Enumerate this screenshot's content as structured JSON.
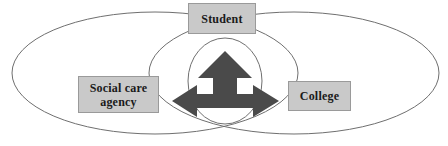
{
  "diagram": {
    "canvas": {
      "width": 448,
      "height": 146,
      "background": "#ffffff"
    },
    "colors": {
      "box_fill": "#c9c9c9",
      "box_border": "#9a9a9a",
      "box_text": "#1a1a1a",
      "ellipse_stroke": "#6f6f6f",
      "arrow_fill": "#4a4a4a"
    },
    "nodes": [
      {
        "id": "student",
        "label": "Student"
      },
      {
        "id": "social_care_agency",
        "label": "Social care\nagency"
      },
      {
        "id": "college",
        "label": "College"
      }
    ],
    "ellipses": [
      {
        "id": "left-ellipse",
        "cx": 155,
        "cy": 73,
        "rx": 143,
        "ry": 61
      },
      {
        "id": "right-ellipse",
        "cx": 294,
        "cy": 73,
        "rx": 145,
        "ry": 61
      },
      {
        "id": "center-ellipse",
        "cx": 225,
        "cy": 81,
        "rx": 37,
        "ry": 43
      }
    ],
    "arrow": {
      "id": "three-way-arrow",
      "directions": [
        "up",
        "left",
        "right"
      ],
      "center_x": 225,
      "center_y": 101,
      "up_tip_y": 51,
      "left_tip_x": 172,
      "right_tip_x": 279
    }
  }
}
